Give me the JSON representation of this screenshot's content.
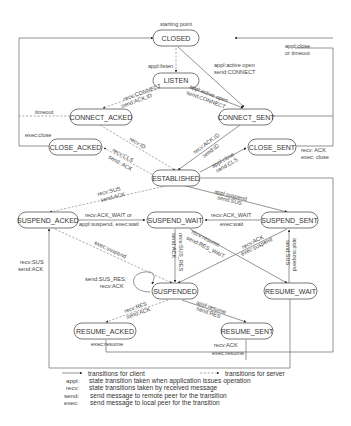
{
  "diagram": {
    "start_label": "starting point",
    "states": {
      "closed": "CLOSED",
      "listen": "LISTEN",
      "connect_acked": "CONNECT_ACKED",
      "connect_sent": "CONNECT_SENT",
      "close_acked": "CLOSE_ACKED",
      "close_sent": "CLOSE_SENT",
      "established": "ESTABLISHED",
      "suspend_acked": "SUSPEND_ACKED",
      "suspend_wait": "SUSPEND_WAIT",
      "suspend_sent": "SUSPEND_SENT",
      "suspended": "SUSPENDED",
      "resume_wait": "RESUME_WAIT",
      "resume_acked": "RESUME_ACKED",
      "resume_sent": "RESUME_SENT"
    },
    "transitions": {
      "closed_close_timeout_1": "appl:close",
      "closed_close_timeout_2": "or timeout",
      "closed_listen": "appl:listen",
      "closed_connect_sent_1": "appl:active open",
      "closed_connect_sent_2": "send:CONNECT",
      "listen_connect_acked_1": "recv:CONNECT",
      "listen_connect_acked_2": "send:ACK,ID",
      "listen_connect_sent_1": "appl:active open",
      "listen_connect_sent_2": "send:CONNECT",
      "connect_acked_timeout": "timeout",
      "close_acked_exec_close": "exec:close",
      "connect_acked_established": "recv:ID",
      "connect_sent_established_1": "recv:ACK,ID",
      "connect_sent_established_2": "send:ID",
      "established_close_acked_1": "recv:CLS",
      "established_close_acked_2": "send: ACK",
      "established_close_sent_1": "appl:close",
      "established_close_sent_2": "send:CLS",
      "close_sent_closed_1": "recv: ACK",
      "close_sent_closed_2": "exec: close",
      "established_suspend_acked_1": "recv:SUS",
      "established_suspend_acked_2": "send:ACK",
      "established_suspend_sent_1": "appl:suspend",
      "established_suspend_sent_2": "send:SUS",
      "suspend_acked_wait_1": "recv:ACK_WAIT or",
      "suspend_acked_wait_2": "appl:suspend, exec:wait",
      "suspend_sent_wait_1": "recv:ACK_WAIT",
      "suspend_sent_wait_2": "exec:wait",
      "suspend_wait_suspended_1": "recv:SUS_RES",
      "suspend_wait_suspended_2": "send:ACK",
      "suspend_wait_resume_wait_1": "recv:resume",
      "suspend_wait_resume_wait_2": "send:RES_WAIT",
      "suspend_sent_suspended_1": "recv:ACK",
      "suspend_sent_suspended_2": "exec:suspend",
      "resume_wait_suspend_sent_1": "appl:suspend",
      "resume_wait_suspend_sent_2": "send:SUS",
      "suspend_acked_suspended": "exec:suspend",
      "suspended_self_1": "send:SUS_RES;",
      "suspended_self_2": "recv:ACK",
      "resume_acked_suspend_acked_1": "recv:SUS",
      "resume_acked_suspend_acked_2": "send:ACK",
      "suspended_resume_acked_1": "recv:RES",
      "suspended_resume_acked_2": "send:ACK",
      "suspended_resume_sent_1": "appl:resume",
      "suspended_resume_sent_2": "send:RES",
      "resume_acked_exec": "exec:resume",
      "resume_sent_established_1": "recv:ACK",
      "resume_sent_established_2": "exec:resume"
    }
  },
  "legend": {
    "client": "transitions for client",
    "server": "transitions for server",
    "rows": [
      {
        "key": "appl:",
        "desc": "state transition taken when application issues operation"
      },
      {
        "key": "recv:",
        "desc": "state transitions taken by received message"
      },
      {
        "key": "send:",
        "desc": "send message to remote peer for the transition"
      },
      {
        "key": "exec:",
        "desc": "send message to local peer for the transition"
      }
    ]
  },
  "colors": {
    "line": "#666666",
    "text": "#333333",
    "background": "#ffffff"
  }
}
